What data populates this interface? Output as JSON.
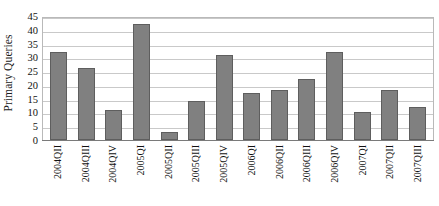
{
  "chart_data": {
    "type": "bar",
    "title": "",
    "xlabel": "",
    "ylabel": "Primary Queries",
    "ylim": [
      0,
      45
    ],
    "yticks": [
      0,
      5,
      10,
      15,
      20,
      25,
      30,
      35,
      40,
      45
    ],
    "grid": true,
    "legend": false,
    "bar_color": "#808080",
    "bar_edge_color": "#5e5e5e",
    "plot_border_color": "#b9b9b9",
    "gridline_color": "#c9c9c9",
    "categories": [
      "2004QII",
      "2004QIII",
      "2004QIV",
      "2005QI",
      "2005QII",
      "2005QIII",
      "2005QIV",
      "2006QI",
      "2006QII",
      "2006QIII",
      "2006QIV",
      "2007QI",
      "2007QII",
      "2007QIII"
    ],
    "values": [
      32,
      26,
      11,
      42,
      3,
      14,
      31,
      17,
      18,
      22,
      32,
      10,
      18,
      12
    ]
  }
}
